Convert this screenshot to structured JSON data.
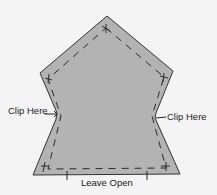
{
  "diagram": {
    "colors": {
      "background": "#f4f4f4",
      "fill": "#b3b3b3",
      "outline": "#333333",
      "stitch": "#2a2a2a"
    },
    "labels": {
      "clip_left": "Clip Here",
      "clip_right": "Clip Here",
      "leave_open": "Leave Open"
    }
  }
}
